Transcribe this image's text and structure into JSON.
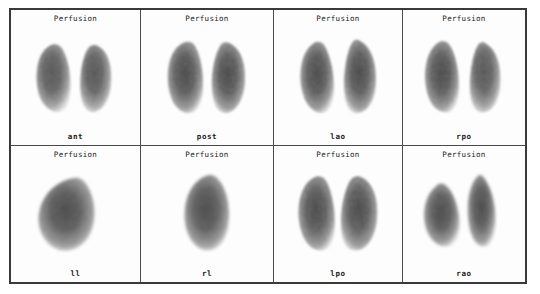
{
  "study": {
    "modality_label": "Perfusion",
    "layout": "4x2",
    "panel_count": 8,
    "background_color": "#ffffff",
    "border_color": "#3a3a3a",
    "image_tone": "grayscale"
  },
  "panels": [
    {
      "title": "Perfusion",
      "view_label": "ant",
      "view_full_name": "anterior",
      "shape": "bilateral-lungs",
      "row": 1,
      "column": 1
    },
    {
      "title": "Perfusion",
      "view_label": "post",
      "view_full_name": "posterior",
      "shape": "bilateral-lungs",
      "row": 1,
      "column": 2
    },
    {
      "title": "Perfusion",
      "view_label": "lao",
      "view_full_name": "left anterior oblique",
      "shape": "bilateral-lungs",
      "row": 1,
      "column": 3
    },
    {
      "title": "Perfusion",
      "view_label": "rpo",
      "view_full_name": "right posterior oblique",
      "shape": "bilateral-lungs",
      "row": 1,
      "column": 4
    },
    {
      "title": "Perfusion",
      "view_label": "ll",
      "view_full_name": "left lateral",
      "shape": "single-lung",
      "row": 2,
      "column": 1
    },
    {
      "title": "Perfusion",
      "view_label": "rl",
      "view_full_name": "right lateral",
      "shape": "single-lung",
      "row": 2,
      "column": 2
    },
    {
      "title": "Perfusion",
      "view_label": "lpo",
      "view_full_name": "left posterior oblique",
      "shape": "bilateral-lungs",
      "row": 2,
      "column": 3
    },
    {
      "title": "Perfusion",
      "view_label": "rao",
      "view_full_name": "right anterior oblique",
      "shape": "bilateral-lungs-split",
      "row": 2,
      "column": 4
    }
  ]
}
